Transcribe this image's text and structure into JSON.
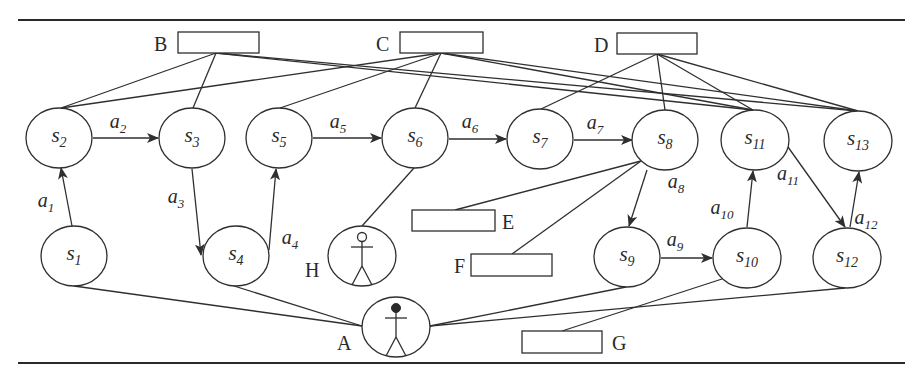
{
  "colors": {
    "stroke": "#2f2f2f",
    "text": "#2a2a2a",
    "background": "#ffffff"
  },
  "rules": [
    {
      "x1": 18,
      "y1": 20,
      "x2": 905,
      "y2": 20
    },
    {
      "x1": 18,
      "y1": 363,
      "x2": 905,
      "y2": 363
    }
  ],
  "states": [
    {
      "id": "s1",
      "prefix": "s",
      "sub": "1",
      "cx": 74,
      "cy": 256,
      "rx": 33,
      "ry": 30
    },
    {
      "id": "s2",
      "prefix": "s",
      "sub": "2",
      "cx": 59,
      "cy": 138,
      "rx": 33,
      "ry": 30
    },
    {
      "id": "s3",
      "prefix": "s",
      "sub": "3",
      "cx": 192,
      "cy": 138,
      "rx": 33,
      "ry": 30
    },
    {
      "id": "s4",
      "prefix": "s",
      "sub": "4",
      "cx": 236,
      "cy": 256,
      "rx": 33,
      "ry": 30
    },
    {
      "id": "s5",
      "prefix": "s",
      "sub": "5",
      "cx": 279,
      "cy": 138,
      "rx": 33,
      "ry": 30
    },
    {
      "id": "s6",
      "prefix": "s",
      "sub": "6",
      "cx": 415,
      "cy": 138,
      "rx": 33,
      "ry": 30
    },
    {
      "id": "s7",
      "prefix": "s",
      "sub": "7",
      "cx": 540,
      "cy": 139,
      "rx": 33,
      "ry": 30
    },
    {
      "id": "s8",
      "prefix": "s",
      "sub": "8",
      "cx": 665,
      "cy": 140,
      "rx": 33,
      "ry": 30
    },
    {
      "id": "s9",
      "prefix": "s",
      "sub": "9",
      "cx": 627,
      "cy": 257,
      "rx": 33,
      "ry": 30
    },
    {
      "id": "s10",
      "prefix": "s",
      "sub": "10",
      "cx": 747,
      "cy": 258,
      "rx": 34,
      "ry": 30
    },
    {
      "id": "s11",
      "prefix": "s",
      "sub": "11",
      "cx": 755,
      "cy": 140,
      "rx": 34,
      "ry": 30
    },
    {
      "id": "s12",
      "prefix": "s",
      "sub": "12",
      "cx": 847,
      "cy": 258,
      "rx": 34,
      "ry": 30
    },
    {
      "id": "s13",
      "prefix": "s",
      "sub": "13",
      "cx": 858,
      "cy": 141,
      "rx": 34,
      "ry": 30
    }
  ],
  "actions": [
    {
      "id": "a1",
      "prefix": "a",
      "sub": "1",
      "x1": 72,
      "y1": 226,
      "x2": 61,
      "y2": 168,
      "lx": 38,
      "ly": 207
    },
    {
      "id": "a2",
      "prefix": "a",
      "sub": "2",
      "x1": 93,
      "y1": 138,
      "x2": 158,
      "y2": 138,
      "lx": 110,
      "ly": 128
    },
    {
      "id": "a3",
      "prefix": "a",
      "sub": "3",
      "x1": 192,
      "y1": 169,
      "x2": 201,
      "y2": 255,
      "lx": 168,
      "ly": 203
    },
    {
      "id": "a4",
      "prefix": "a",
      "sub": "4",
      "x1": 269,
      "y1": 250,
      "x2": 276,
      "y2": 169,
      "lx": 282,
      "ly": 244
    },
    {
      "id": "a5",
      "prefix": "a",
      "sub": "5",
      "x1": 313,
      "y1": 138,
      "x2": 381,
      "y2": 138,
      "lx": 330,
      "ly": 128
    },
    {
      "id": "a6",
      "prefix": "a",
      "sub": "6",
      "x1": 449,
      "y1": 139,
      "x2": 506,
      "y2": 139,
      "lx": 462,
      "ly": 128
    },
    {
      "id": "a7",
      "prefix": "a",
      "sub": "7",
      "x1": 574,
      "y1": 140,
      "x2": 632,
      "y2": 140,
      "lx": 587,
      "ly": 129
    },
    {
      "id": "a8",
      "prefix": "a",
      "sub": "8",
      "x1": 647,
      "y1": 170,
      "x2": 629,
      "y2": 226,
      "lx": 668,
      "ly": 188
    },
    {
      "id": "a9",
      "prefix": "a",
      "sub": "9",
      "x1": 661,
      "y1": 258,
      "x2": 712,
      "y2": 258,
      "lx": 667,
      "ly": 246
    },
    {
      "id": "a10",
      "prefix": "a",
      "sub": "10",
      "x1": 747,
      "y1": 227,
      "x2": 753,
      "y2": 171,
      "lx": 714,
      "ly": 214
    },
    {
      "id": "a11",
      "prefix": "a",
      "sub": "11",
      "x1": 788,
      "y1": 147,
      "x2": 845,
      "y2": 227,
      "lx": 780,
      "ly": 180
    },
    {
      "id": "a12",
      "prefix": "a",
      "sub": "12",
      "x1": 850,
      "y1": 227,
      "x2": 859,
      "y2": 172,
      "lx": 858,
      "ly": 224
    }
  ],
  "boxes": [
    {
      "id": "B",
      "label": "B",
      "x": 178,
      "y": 32,
      "w": 81,
      "h": 21,
      "lx": 154,
      "ly": 51,
      "anchor": "start"
    },
    {
      "id": "C",
      "label": "C",
      "x": 400,
      "y": 32,
      "w": 83,
      "h": 21,
      "lx": 376,
      "ly": 51,
      "anchor": "start"
    },
    {
      "id": "D",
      "label": "D",
      "x": 617,
      "y": 33,
      "w": 80,
      "h": 21,
      "lx": 594,
      "ly": 52,
      "anchor": "start"
    },
    {
      "id": "E",
      "label": "E",
      "x": 412,
      "y": 210,
      "w": 83,
      "h": 21,
      "lx": 502,
      "ly": 229,
      "anchor": "start"
    },
    {
      "id": "F",
      "label": "F",
      "x": 471,
      "y": 254,
      "w": 81,
      "h": 22,
      "lx": 454,
      "ly": 273,
      "anchor": "start"
    },
    {
      "id": "G",
      "label": "G",
      "x": 522,
      "y": 331,
      "w": 80,
      "h": 22,
      "lx": 612,
      "ly": 350,
      "anchor": "start"
    }
  ],
  "actors": [
    {
      "id": "H",
      "label": "H",
      "cx": 362,
      "cy": 256,
      "rx": 34,
      "ry": 30,
      "head": "open",
      "lx": 305,
      "ly": 277
    },
    {
      "id": "A",
      "label": "A",
      "cx": 396,
      "cy": 327,
      "rx": 34,
      "ry": 30,
      "head": "filled",
      "lx": 337,
      "ly": 350
    }
  ],
  "links": [
    {
      "from": "B",
      "x1": 216,
      "y1": 53,
      "x2": 61,
      "y2": 108
    },
    {
      "from": "B",
      "x1": 216,
      "y1": 53,
      "x2": 193,
      "y2": 108
    },
    {
      "from": "B",
      "x1": 216,
      "y1": 53,
      "x2": 753,
      "y2": 110
    },
    {
      "from": "B",
      "x1": 216,
      "y1": 53,
      "x2": 858,
      "y2": 111
    },
    {
      "from": "C",
      "x1": 441,
      "y1": 53,
      "x2": 61,
      "y2": 108
    },
    {
      "from": "C",
      "x1": 441,
      "y1": 53,
      "x2": 280,
      "y2": 108
    },
    {
      "from": "C",
      "x1": 441,
      "y1": 53,
      "x2": 415,
      "y2": 108
    },
    {
      "from": "C",
      "x1": 441,
      "y1": 53,
      "x2": 753,
      "y2": 110
    },
    {
      "from": "C",
      "x1": 441,
      "y1": 53,
      "x2": 858,
      "y2": 111
    },
    {
      "from": "D",
      "x1": 657,
      "y1": 54,
      "x2": 541,
      "y2": 109
    },
    {
      "from": "D",
      "x1": 657,
      "y1": 54,
      "x2": 665,
      "y2": 110
    },
    {
      "from": "D",
      "x1": 657,
      "y1": 54,
      "x2": 753,
      "y2": 110
    },
    {
      "from": "D",
      "x1": 657,
      "y1": 54,
      "x2": 858,
      "y2": 111
    },
    {
      "from": "s8",
      "x1": 641,
      "y1": 161,
      "x2": 455,
      "y2": 210
    },
    {
      "from": "s8",
      "x1": 641,
      "y1": 161,
      "x2": 512,
      "y2": 254
    },
    {
      "from": "s6",
      "x1": 414,
      "y1": 168,
      "x2": 362,
      "y2": 226
    },
    {
      "from": "s10",
      "x1": 722,
      "y1": 279,
      "x2": 562,
      "y2": 331
    },
    {
      "from": "A",
      "x1": 74,
      "y1": 286,
      "x2": 362,
      "y2": 326
    },
    {
      "from": "A",
      "x1": 234,
      "y1": 286,
      "x2": 362,
      "y2": 326
    },
    {
      "from": "A",
      "x1": 430,
      "y1": 326,
      "x2": 626,
      "y2": 287
    },
    {
      "from": "A",
      "x1": 430,
      "y1": 326,
      "x2": 845,
      "y2": 288
    }
  ]
}
